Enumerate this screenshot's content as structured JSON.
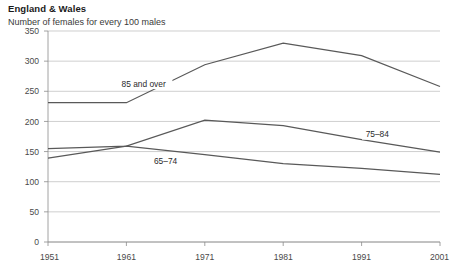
{
  "chart_data": {
    "type": "line",
    "title": "England & Wales",
    "subtitle": "Number of females for every 100 males",
    "xlabel": "",
    "ylabel": "",
    "x": [
      1951,
      1961,
      1971,
      1981,
      1991,
      2001
    ],
    "xtick_labels": [
      "1951",
      "1961",
      "1971",
      "1981",
      "1991",
      "2001"
    ],
    "ytick_labels": [
      "0",
      "50",
      "100",
      "150",
      "200",
      "250",
      "300",
      "350"
    ],
    "yticks": [
      0,
      50,
      100,
      150,
      200,
      250,
      300,
      350
    ],
    "ylim": [
      0,
      350
    ],
    "xlim": [
      1951,
      2001
    ],
    "grid": "horizontal",
    "legend": "inline-series-labels",
    "line_color": "#595959",
    "grid_color": "#b9b9b9",
    "axis_color": "#8c8c8c",
    "series": [
      {
        "name": "85 and over",
        "label": "85 and over",
        "label_x": 1963.2,
        "label_y": 262,
        "values": [
          231,
          231,
          294,
          330,
          309,
          258
        ]
      },
      {
        "name": "75-84",
        "label": "75–84",
        "label_x": 1993.0,
        "label_y": 178,
        "values": [
          155,
          159,
          202,
          193,
          170,
          149
        ]
      },
      {
        "name": "65-74",
        "label": "65–74",
        "label_x": 1966.0,
        "label_y": 133,
        "values": [
          139,
          159,
          145,
          130,
          122,
          112
        ]
      }
    ]
  }
}
